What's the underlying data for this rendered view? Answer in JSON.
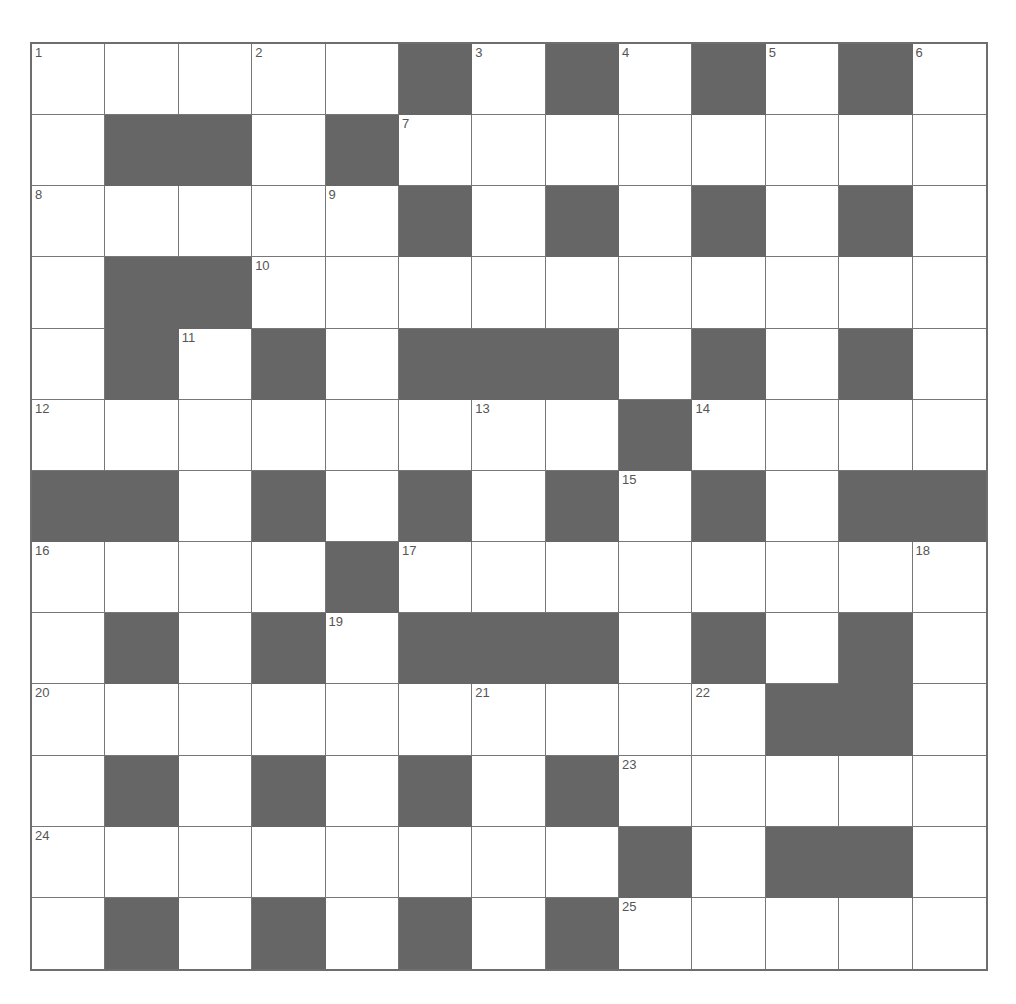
{
  "puzzle": {
    "rows": 13,
    "cols": 13,
    "colors": {
      "block": "#666666",
      "cell": "#ffffff",
      "grid_line": "#777777",
      "number": "#555555"
    },
    "grid": [
      "WWWWW#W#W#W#W",
      "W##W#WWWWWWWW",
      "WWWWW#W#W#W#W",
      "W##WWWWWWWWWW",
      "W#W#W###W#W#W",
      "WWWWWWWW#WWWW",
      "##W#W#W#W#W##",
      "WWWW#WWWWWWWW",
      "W#W#W###W#W#W",
      "WWWWWWWWWW##W",
      "W#W#W#W#WWWWW",
      "WWWWWWWW#W##W",
      "W#W#W#W#WWWWW"
    ],
    "numbers": [
      {
        "n": "1",
        "r": 0,
        "c": 0
      },
      {
        "n": "2",
        "r": 0,
        "c": 3
      },
      {
        "n": "3",
        "r": 0,
        "c": 6
      },
      {
        "n": "4",
        "r": 0,
        "c": 8
      },
      {
        "n": "5",
        "r": 0,
        "c": 10
      },
      {
        "n": "6",
        "r": 0,
        "c": 12
      },
      {
        "n": "7",
        "r": 1,
        "c": 5
      },
      {
        "n": "8",
        "r": 2,
        "c": 0
      },
      {
        "n": "9",
        "r": 2,
        "c": 4
      },
      {
        "n": "10",
        "r": 3,
        "c": 3
      },
      {
        "n": "11",
        "r": 4,
        "c": 2
      },
      {
        "n": "12",
        "r": 5,
        "c": 0
      },
      {
        "n": "13",
        "r": 5,
        "c": 6
      },
      {
        "n": "14",
        "r": 5,
        "c": 9
      },
      {
        "n": "15",
        "r": 6,
        "c": 8
      },
      {
        "n": "16",
        "r": 7,
        "c": 0
      },
      {
        "n": "17",
        "r": 7,
        "c": 5
      },
      {
        "n": "18",
        "r": 7,
        "c": 12
      },
      {
        "n": "19",
        "r": 8,
        "c": 4
      },
      {
        "n": "20",
        "r": 9,
        "c": 0
      },
      {
        "n": "21",
        "r": 9,
        "c": 6
      },
      {
        "n": "22",
        "r": 9,
        "c": 9
      },
      {
        "n": "23",
        "r": 10,
        "c": 8
      },
      {
        "n": "24",
        "r": 11,
        "c": 0
      },
      {
        "n": "25",
        "r": 12,
        "c": 8
      }
    ]
  }
}
